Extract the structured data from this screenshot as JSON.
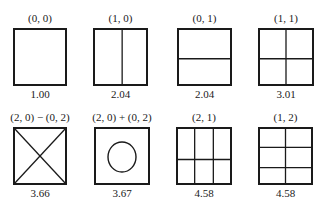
{
  "figure": {
    "modes": [
      {
        "title": "(0, 0)",
        "value": "1.00",
        "pattern": "plain",
        "box": {
          "x": 13,
          "y": 28,
          "w": 54,
          "h": 58
        }
      },
      {
        "title": "(1, 0)",
        "value": "2.04",
        "pattern": "vertical-split-2",
        "box": {
          "x": 93,
          "y": 28,
          "w": 55,
          "h": 58
        }
      },
      {
        "title": "(0, 1)",
        "value": "2.04",
        "pattern": "horizontal-split-2",
        "box": {
          "x": 177,
          "y": 28,
          "w": 55,
          "h": 58
        }
      },
      {
        "title": "(1, 1)",
        "value": "3.01",
        "pattern": "grid-2x2",
        "box": {
          "x": 258,
          "y": 28,
          "w": 56,
          "h": 58
        }
      },
      {
        "title": "(2, 0) − (0, 2)",
        "value": "3.66",
        "pattern": "diagonal-cross",
        "box": {
          "x": 13,
          "y": 127,
          "w": 54,
          "h": 58
        }
      },
      {
        "title": "(2, 0) + (0, 2)",
        "value": "3.67",
        "pattern": "inner-circle",
        "box": {
          "x": 94,
          "y": 127,
          "w": 56,
          "h": 58
        }
      },
      {
        "title": "(2, 1)",
        "value": "4.58",
        "pattern": "grid-3col-2row",
        "box": {
          "x": 176,
          "y": 127,
          "w": 56,
          "h": 58
        }
      },
      {
        "title": "(1, 2)",
        "value": "4.58",
        "pattern": "grid-2col-3row",
        "box": {
          "x": 258,
          "y": 127,
          "w": 55,
          "h": 58
        }
      }
    ],
    "stroke_color": "#1a1a1a"
  }
}
